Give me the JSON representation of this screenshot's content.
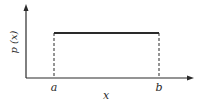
{
  "diagram": {
    "type": "uniform-distribution",
    "y_axis_label": "p (x)",
    "x_axis_label": "x",
    "lower_bound_label": "a",
    "upper_bound_label": "b",
    "colors": {
      "ink": "#2a2a2a"
    }
  }
}
